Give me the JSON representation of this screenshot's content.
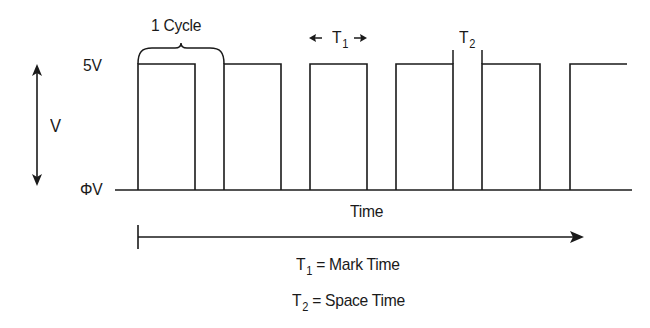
{
  "diagram": {
    "type": "square-wave-timing",
    "labels": {
      "cycle": "1 Cycle",
      "high_level": "5V",
      "low_level": "ΦV",
      "voltage_axis": "V",
      "time_axis": "Time",
      "t1_symbol": "T",
      "t1_sub": "1",
      "t2_symbol": "T",
      "t2_sub": "2"
    },
    "legend": [
      {
        "symbol": "T",
        "sub": "1",
        "text": "= Mark Time"
      },
      {
        "symbol": "T",
        "sub": "2",
        "text": "= Space Time"
      }
    ],
    "levels": {
      "high_y": 64,
      "low_y": 190
    },
    "pulses": [
      {
        "rise_x": 138,
        "fall_x": 195
      },
      {
        "rise_x": 224,
        "fall_x": 281
      },
      {
        "rise_x": 310,
        "fall_x": 367
      },
      {
        "rise_x": 396,
        "fall_x": 453
      },
      {
        "rise_x": 482,
        "fall_x": 540
      },
      {
        "rise_x": 570,
        "fall_x": 627
      }
    ],
    "colors": {
      "line": "#1a1a1a",
      "background": "#ffffff"
    }
  }
}
